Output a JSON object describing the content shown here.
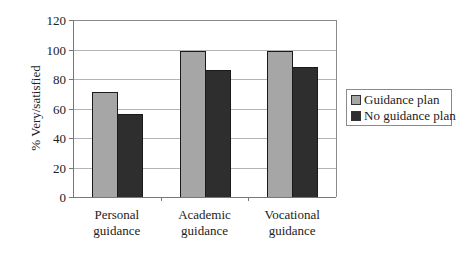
{
  "chart_data": {
    "type": "bar",
    "title": "",
    "xlabel": "",
    "ylabel": "% Very/satisfied",
    "ylim": [
      0,
      120
    ],
    "yticks": [
      0,
      20,
      40,
      60,
      80,
      100,
      120
    ],
    "grid": true,
    "legend_position": "right",
    "categories": [
      "Personal guidance",
      "Academic guidance",
      "Vocational guidance"
    ],
    "category_lines": [
      [
        "Personal",
        "guidance"
      ],
      [
        "Academic",
        "guidance"
      ],
      [
        "Vocational",
        "guidance"
      ]
    ],
    "series": [
      {
        "name": "Guidance plan",
        "color": "#a6a6a6",
        "values": [
          71,
          99,
          99
        ]
      },
      {
        "name": "No guidance plan",
        "color": "#2e2e2e",
        "values": [
          56,
          86,
          88
        ]
      }
    ]
  },
  "legend": {
    "items": [
      {
        "label": "Guidance plan",
        "color": "#a6a6a6"
      },
      {
        "label": "No guidance plan",
        "color": "#2e2e2e"
      }
    ]
  }
}
